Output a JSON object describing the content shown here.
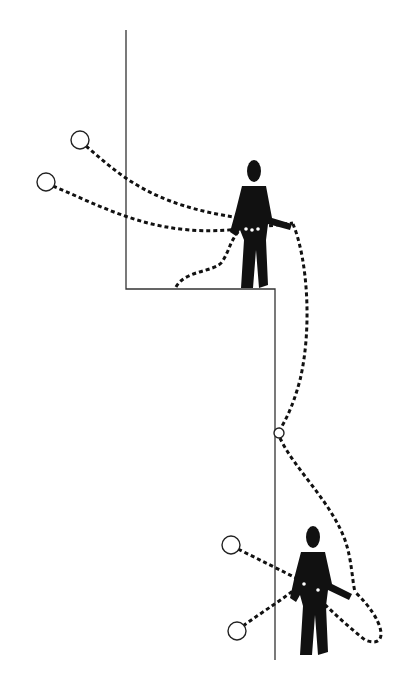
{
  "diagram": {
    "type": "illustration",
    "colors": {
      "ink": "#111111",
      "background": "#ffffff",
      "wall": "#333333"
    },
    "elements": {
      "worker_top": {
        "label": "worker on ledge",
        "x": 252,
        "y": 160
      },
      "worker_bottom": {
        "label": "worker on wall face",
        "x": 312,
        "y": 525
      },
      "anchors_top": [
        {
          "cx": 80,
          "cy": 140
        },
        {
          "cx": 46,
          "cy": 182
        }
      ],
      "anchors_bottom": [
        {
          "cx": 231,
          "cy": 545
        },
        {
          "cx": 237,
          "cy": 631
        }
      ],
      "intermediate_anchor": {
        "cx": 279,
        "cy": 433
      }
    }
  }
}
